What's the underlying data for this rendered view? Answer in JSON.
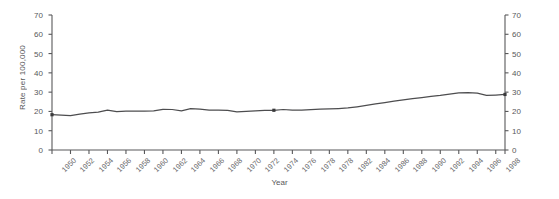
{
  "chart_data": {
    "type": "line",
    "title": "",
    "xlabel": "Year",
    "ylabel": "Rate per 100,000",
    "xlim": [
      1950,
      1999
    ],
    "ylim": [
      0,
      70
    ],
    "yticks": [
      0,
      10,
      20,
      30,
      40,
      50,
      60,
      70
    ],
    "grid": false,
    "legend": null,
    "dual_y_axis": true,
    "right_axis_ticks": [
      0,
      10,
      20,
      30,
      40,
      50,
      60,
      70
    ],
    "tick_interval_years": 2,
    "line_color": "#4d4d4f",
    "categories": [
      "1950",
      "1951",
      "1952",
      "1953",
      "1954",
      "1955",
      "1956",
      "1957",
      "1958",
      "1959",
      "1960",
      "1961",
      "1962",
      "1963",
      "1964",
      "1965",
      "1966",
      "1967",
      "1968",
      "1969",
      "1970",
      "1971",
      "1972",
      "1973",
      "1974",
      "1975",
      "1976",
      "1977",
      "1978",
      "1979",
      "1980",
      "1981",
      "1982",
      "1983",
      "1984",
      "1985",
      "1986",
      "1987",
      "1988",
      "1989",
      "1990",
      "1991",
      "1992",
      "1993",
      "1994",
      "1995",
      "1996",
      "1997",
      "1998",
      "1999"
    ],
    "x": [
      1950,
      1951,
      1952,
      1953,
      1954,
      1955,
      1956,
      1957,
      1958,
      1959,
      1960,
      1961,
      1962,
      1963,
      1964,
      1965,
      1966,
      1967,
      1968,
      1969,
      1970,
      1971,
      1972,
      1973,
      1974,
      1975,
      1976,
      1977,
      1978,
      1979,
      1980,
      1981,
      1982,
      1983,
      1984,
      1985,
      1986,
      1987,
      1988,
      1989,
      1990,
      1991,
      1992,
      1993,
      1994,
      1995,
      1996,
      1997,
      1998,
      1999
    ],
    "values": [
      18.3,
      18.1,
      17.8,
      18.6,
      19.3,
      19.6,
      20.7,
      19.9,
      20.1,
      20.2,
      20.2,
      20.3,
      21.1,
      21.0,
      20.3,
      21.4,
      21.2,
      20.7,
      20.7,
      20.6,
      19.8,
      20.0,
      20.3,
      20.5,
      20.6,
      21.0,
      20.7,
      20.7,
      20.9,
      21.2,
      21.3,
      21.5,
      21.8,
      22.4,
      23.1,
      23.9,
      24.6,
      25.3,
      26.0,
      26.7,
      27.2,
      27.8,
      28.3,
      29.0,
      29.6,
      29.7,
      29.5,
      28.3,
      28.5,
      28.8
    ],
    "marker_points": [
      {
        "x": 1950,
        "y": 18.3
      },
      {
        "x": 1974,
        "y": 20.6
      },
      {
        "x": 1999,
        "y": 28.8
      }
    ],
    "xtick_labels": [
      "1950",
      "1952",
      "1954",
      "1956",
      "1958",
      "1960",
      "1962",
      "1964",
      "1966",
      "1968",
      "1970",
      "1972",
      "1974",
      "1976",
      "1978",
      "1978",
      "1982",
      "1984",
      "1986",
      "1988",
      "1990",
      "1992",
      "1994",
      "1996",
      "1998"
    ]
  }
}
